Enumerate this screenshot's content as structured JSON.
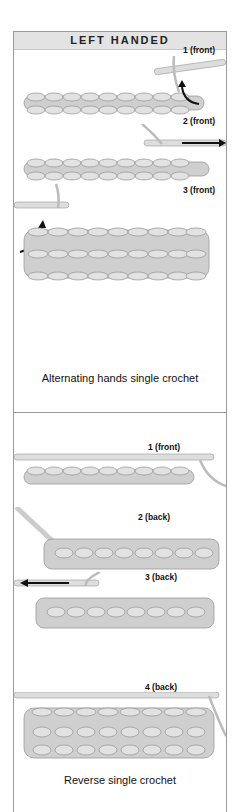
{
  "header": {
    "title": "LEFT HANDED"
  },
  "section1": {
    "caption": "Alternating hands single crochet",
    "steps": [
      {
        "label": "1 (front)"
      },
      {
        "label": "2 (front)"
      },
      {
        "label": "3 (front)"
      }
    ]
  },
  "section2": {
    "caption": "Reverse single crochet",
    "steps": [
      {
        "label": "1 (front)"
      },
      {
        "label": "2 (back)"
      },
      {
        "label": "3 (back)"
      },
      {
        "label": "4 (back)"
      }
    ]
  },
  "colors": {
    "yarn": "#c9c9c9",
    "yarn_dark": "#9a9a9a",
    "arrow": "#111111",
    "header_bg": "#e3e3e3",
    "border": "#9a9a9a"
  }
}
